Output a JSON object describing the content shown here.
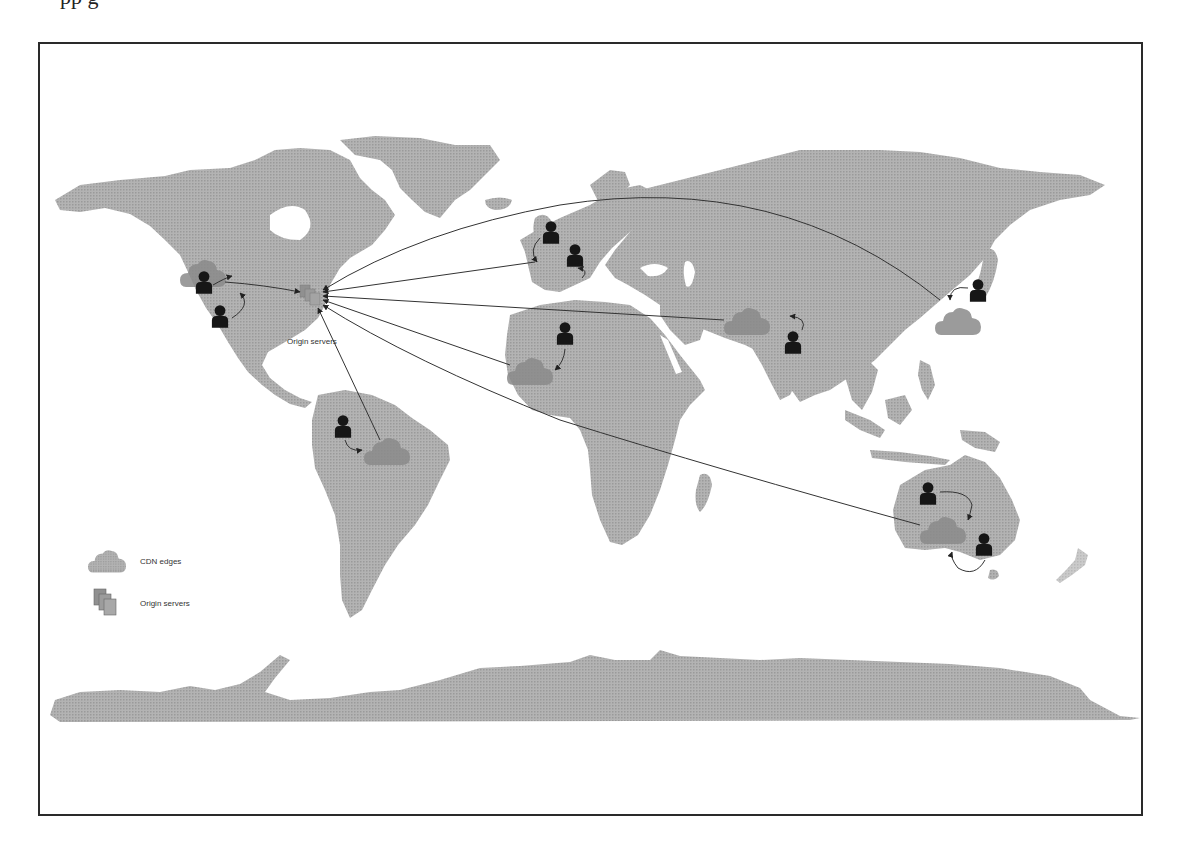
{
  "page": {
    "top_text_fragment": "                 pp                                                    g"
  },
  "figure": {
    "colors": {
      "land": "#a9a9a9",
      "cdn_cloud": "#8f8f8f",
      "user": "#1a1a1a",
      "line": "#333333",
      "frame": "#2a2a2a"
    },
    "origin_label": "Origin servers",
    "legend": {
      "items": [
        {
          "icon": "cloud-icon",
          "label": "CDN edges"
        },
        {
          "icon": "server-stack-icon",
          "label": "Origin servers"
        }
      ]
    },
    "cdn_edges": [
      {
        "region": "Western North America",
        "x": 205,
        "y": 272
      },
      {
        "region": "Brazil",
        "x": 387,
        "y": 450
      },
      {
        "region": "West Africa",
        "x": 530,
        "y": 370
      },
      {
        "region": "India",
        "x": 748,
        "y": 320
      },
      {
        "region": "Japan / East Asia",
        "x": 958,
        "y": 320
      },
      {
        "region": "Australia",
        "x": 945,
        "y": 530
      },
      {
        "region": "Western Europe",
        "x": 555,
        "y": 262
      }
    ],
    "users": [
      {
        "region": "Western US (north)",
        "x": 205,
        "y": 283
      },
      {
        "region": "Western US (south)",
        "x": 220,
        "y": 316
      },
      {
        "region": "UK",
        "x": 551,
        "y": 231
      },
      {
        "region": "France",
        "x": 575,
        "y": 262
      },
      {
        "region": "West Africa",
        "x": 565,
        "y": 335
      },
      {
        "region": "India",
        "x": 793,
        "y": 342
      },
      {
        "region": "Japan",
        "x": 978,
        "y": 291
      },
      {
        "region": "Brazil",
        "x": 343,
        "y": 428
      },
      {
        "region": "Western Australia",
        "x": 928,
        "y": 494
      },
      {
        "region": "Eastern Australia",
        "x": 984,
        "y": 546
      }
    ],
    "origin": {
      "x": 313,
      "y": 295
    }
  }
}
